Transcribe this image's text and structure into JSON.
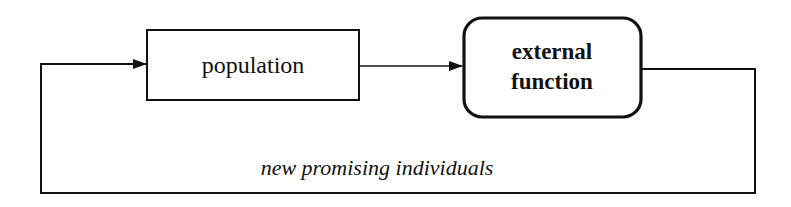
{
  "diagram": {
    "nodes": [
      {
        "id": "population",
        "label": "population",
        "shape": "rectangle"
      },
      {
        "id": "external_function",
        "label_lines": [
          "external",
          "function"
        ],
        "shape": "rounded-rectangle",
        "bold": true
      }
    ],
    "edges": [
      {
        "from": "population",
        "to": "external_function"
      },
      {
        "from": "external_function",
        "to": "population",
        "label": "new promising individuals"
      }
    ],
    "colors": {
      "stroke": "#111111",
      "background": "#ffffff"
    }
  }
}
